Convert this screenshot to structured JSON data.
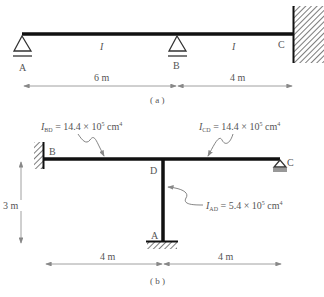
{
  "diagram_a": {
    "caption": "( a )",
    "nodes": {
      "A": "A",
      "B": "B",
      "C": "C"
    },
    "member_labels": {
      "AB": "I",
      "BC": "I"
    },
    "dimensions": {
      "AB": "6 m",
      "BC": "4 m"
    },
    "supports": {
      "A": "pin",
      "B": "pin",
      "C": "fixed-wall"
    }
  },
  "diagram_b": {
    "caption": "( b )",
    "nodes": {
      "A": "A",
      "B": "B",
      "C": "C",
      "D": "D"
    },
    "annotations": {
      "BD": {
        "sym": "I",
        "sub": "BD",
        "text": " = 14.4 × 10",
        "exp": "5",
        "unit": " cm",
        "unit_exp": "4"
      },
      "CD": {
        "sym": "I",
        "sub": "CD",
        "text": " = 14.4 × 10",
        "exp": "5",
        "unit": " cm",
        "unit_exp": "4"
      },
      "AD": {
        "sym": "I",
        "sub": "AD",
        "text": " = 5.4 × 10",
        "exp": "5",
        "unit": " cm",
        "unit_exp": "4"
      }
    },
    "dimensions": {
      "BD": "4 m",
      "DC": "4 m",
      "height": "3 m"
    },
    "supports": {
      "A": "fixed",
      "B": "fixed-wall",
      "C": "roller"
    }
  },
  "colors": {
    "member": "#111111",
    "line": "#777777",
    "text": "#555555"
  }
}
